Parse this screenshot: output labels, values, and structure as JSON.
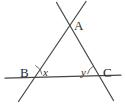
{
  "figure": {
    "kind": "geometry-diagram",
    "background_color": "#ffffff",
    "stroke_color": "#454545",
    "label_color": "#2b2b2b",
    "stroke_width": 1.2,
    "canvas": {
      "width": 125,
      "height": 108
    }
  },
  "vertices": [
    {
      "id": "A",
      "label": "A",
      "x": 70,
      "y": 26,
      "role": "apex-intersection"
    },
    {
      "id": "B",
      "label": "B",
      "x": 30,
      "y": 77,
      "role": "left-base-intersection"
    },
    {
      "id": "C",
      "label": "C",
      "x": 99,
      "y": 77,
      "role": "right-base-intersection"
    }
  ],
  "angles": [
    {
      "id": "x",
      "label": "x",
      "at_vertex": "B",
      "position": "interior-right-of-B",
      "arc": true
    },
    {
      "id": "y",
      "label": "y",
      "at_vertex": "C",
      "position": "interior-left-of-C",
      "arc": true
    }
  ],
  "lines": [
    {
      "id": "base-line",
      "name": "horizontal-base-line",
      "from": {
        "x": 5,
        "y": 78
      },
      "to": {
        "x": 121,
        "y": 75
      },
      "passes_through": [
        "B",
        "C"
      ]
    },
    {
      "id": "line-through-A-and-B",
      "name": "left-transversal",
      "from": {
        "x": 86,
        "y": 2
      },
      "to": {
        "x": 19,
        "y": 101
      },
      "passes_through": [
        "A",
        "B"
      ]
    },
    {
      "id": "line-through-A-and-C",
      "name": "right-transversal",
      "from": {
        "x": 57,
        "y": 3
      },
      "to": {
        "x": 113,
        "y": 100
      },
      "passes_through": [
        "A",
        "C"
      ]
    }
  ],
  "arcs": [
    {
      "id": "arc-x",
      "at_vertex": "B",
      "center": {
        "x": 30,
        "y": 77
      },
      "radius": 15,
      "start_deg": 188,
      "end_deg": 236
    },
    {
      "id": "arc-y",
      "at_vertex": "C",
      "center": {
        "x": 99,
        "y": 77
      },
      "radius": 14,
      "start_deg": 180,
      "end_deg": 240
    }
  ]
}
